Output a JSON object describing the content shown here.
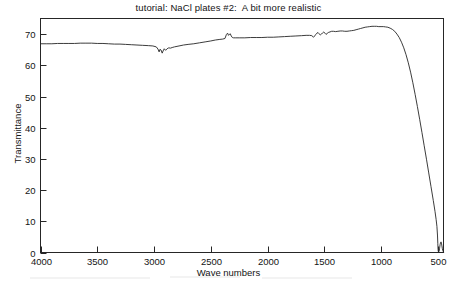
{
  "chart_data": {
    "type": "line",
    "title": "tutorial: NaCl plates #2:  A bit more realistic",
    "xlabel": "Wave numbers",
    "ylabel": "Transmittance",
    "xlim": [
      4000,
      450
    ],
    "ylim": [
      0,
      75
    ],
    "x_ticks": [
      4000,
      3500,
      3000,
      2500,
      2000,
      1500,
      1000,
      500
    ],
    "x_tick_labels": [
      "4000",
      "3500",
      "3000",
      "2500",
      "2000",
      "1500",
      "1000",
      "500"
    ],
    "y_ticks": [
      0,
      10,
      20,
      30,
      40,
      50,
      60,
      70
    ],
    "y_tick_labels": [
      "0",
      "10",
      "20",
      "30",
      "40",
      "50",
      "60",
      "70"
    ],
    "grid": false,
    "legend": "none",
    "x_axis_reversed": true,
    "series": [
      {
        "name": "transmittance",
        "color": "#262626",
        "points": [
          [
            4000,
            66.9
          ],
          [
            3950,
            66.9
          ],
          [
            3900,
            66.9
          ],
          [
            3850,
            67.0
          ],
          [
            3800,
            67.0
          ],
          [
            3750,
            67.0
          ],
          [
            3700,
            67.0
          ],
          [
            3650,
            67.1
          ],
          [
            3600,
            67.1
          ],
          [
            3550,
            67.1
          ],
          [
            3500,
            67.0
          ],
          [
            3450,
            67.0
          ],
          [
            3400,
            66.9
          ],
          [
            3350,
            66.8
          ],
          [
            3300,
            66.8
          ],
          [
            3250,
            66.7
          ],
          [
            3200,
            66.6
          ],
          [
            3150,
            66.5
          ],
          [
            3100,
            66.4
          ],
          [
            3050,
            66.3
          ],
          [
            3010,
            66.2
          ],
          [
            2980,
            65.9
          ],
          [
            2965,
            65.2
          ],
          [
            2955,
            64.3
          ],
          [
            2948,
            65.1
          ],
          [
            2938,
            64.9
          ],
          [
            2928,
            63.9
          ],
          [
            2920,
            64.6
          ],
          [
            2910,
            65.3
          ],
          [
            2898,
            64.8
          ],
          [
            2885,
            65.3
          ],
          [
            2870,
            65.6
          ],
          [
            2855,
            65.5
          ],
          [
            2840,
            65.7
          ],
          [
            2820,
            65.9
          ],
          [
            2780,
            66.2
          ],
          [
            2740,
            66.5
          ],
          [
            2700,
            66.7
          ],
          [
            2650,
            66.9
          ],
          [
            2600,
            67.2
          ],
          [
            2550,
            67.5
          ],
          [
            2500,
            67.8
          ],
          [
            2460,
            68.1
          ],
          [
            2420,
            68.3
          ],
          [
            2395,
            68.4
          ],
          [
            2375,
            68.6
          ],
          [
            2362,
            69.9
          ],
          [
            2352,
            70.3
          ],
          [
            2344,
            69.6
          ],
          [
            2336,
            69.9
          ],
          [
            2328,
            70.1
          ],
          [
            2320,
            69.4
          ],
          [
            2310,
            68.9
          ],
          [
            2300,
            68.8
          ],
          [
            2280,
            68.8
          ],
          [
            2250,
            68.8
          ],
          [
            2200,
            68.8
          ],
          [
            2150,
            68.9
          ],
          [
            2100,
            68.9
          ],
          [
            2050,
            68.9
          ],
          [
            2000,
            69.0
          ],
          [
            1950,
            69.0
          ],
          [
            1900,
            69.1
          ],
          [
            1850,
            69.2
          ],
          [
            1800,
            69.3
          ],
          [
            1750,
            69.4
          ],
          [
            1700,
            69.5
          ],
          [
            1660,
            69.6
          ],
          [
            1630,
            69.6
          ],
          [
            1610,
            69.5
          ],
          [
            1595,
            69.0
          ],
          [
            1585,
            69.4
          ],
          [
            1575,
            69.9
          ],
          [
            1565,
            70.3
          ],
          [
            1555,
            70.5
          ],
          [
            1545,
            70.1
          ],
          [
            1535,
            69.7
          ],
          [
            1525,
            70.0
          ],
          [
            1515,
            70.4
          ],
          [
            1505,
            70.7
          ],
          [
            1495,
            70.3
          ],
          [
            1485,
            69.9
          ],
          [
            1475,
            70.2
          ],
          [
            1465,
            70.5
          ],
          [
            1450,
            70.7
          ],
          [
            1435,
            70.9
          ],
          [
            1420,
            70.9
          ],
          [
            1400,
            70.8
          ],
          [
            1380,
            70.9
          ],
          [
            1360,
            71.0
          ],
          [
            1340,
            71.0
          ],
          [
            1320,
            70.9
          ],
          [
            1300,
            70.9
          ],
          [
            1280,
            71.0
          ],
          [
            1260,
            71.1
          ],
          [
            1240,
            71.2
          ],
          [
            1220,
            71.4
          ],
          [
            1200,
            71.6
          ],
          [
            1180,
            71.8
          ],
          [
            1160,
            72.0
          ],
          [
            1140,
            72.2
          ],
          [
            1120,
            72.3
          ],
          [
            1100,
            72.4
          ],
          [
            1080,
            72.5
          ],
          [
            1060,
            72.5
          ],
          [
            1040,
            72.5
          ],
          [
            1020,
            72.4
          ],
          [
            1000,
            72.4
          ],
          [
            980,
            72.4
          ],
          [
            960,
            72.3
          ],
          [
            940,
            72.2
          ],
          [
            920,
            71.9
          ],
          [
            900,
            71.5
          ],
          [
            880,
            70.9
          ],
          [
            860,
            70.0
          ],
          [
            840,
            68.9
          ],
          [
            820,
            67.4
          ],
          [
            800,
            65.6
          ],
          [
            780,
            63.4
          ],
          [
            760,
            60.8
          ],
          [
            740,
            57.8
          ],
          [
            720,
            54.4
          ],
          [
            700,
            50.7
          ],
          [
            680,
            46.8
          ],
          [
            660,
            42.7
          ],
          [
            640,
            38.5
          ],
          [
            620,
            34.2
          ],
          [
            600,
            29.9
          ],
          [
            580,
            25.5
          ],
          [
            560,
            21.1
          ],
          [
            540,
            16.7
          ],
          [
            525,
            13.2
          ],
          [
            515,
            10.6
          ],
          [
            508,
            8.4
          ],
          [
            503,
            5.6
          ],
          [
            500,
            2.8
          ],
          [
            498,
            1.0
          ],
          [
            496,
            0.3
          ],
          [
            492,
            0.2
          ],
          [
            488,
            0.5
          ],
          [
            484,
            1.4
          ],
          [
            480,
            2.5
          ],
          [
            476,
            3.2
          ],
          [
            472,
            3.4
          ],
          [
            468,
            3.0
          ],
          [
            464,
            2.1
          ],
          [
            460,
            1.2
          ],
          [
            456,
            0.6
          ],
          [
            452,
            0.3
          ],
          [
            450,
            0.2
          ]
        ]
      }
    ]
  },
  "axis_style": {
    "frame_color": "#262626",
    "line_color": "#262626",
    "text_color": "#141414",
    "background": "#ffffff"
  }
}
